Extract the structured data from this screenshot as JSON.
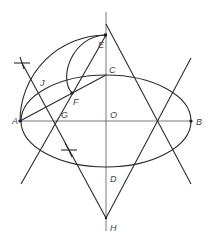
{
  "diagram": {
    "title": "",
    "type": "ellipse construction (concentric circle / parallelogram method)",
    "points": {
      "A": {
        "label": "A",
        "x": 20,
        "y": 121
      },
      "B": {
        "label": "B",
        "x": 191,
        "y": 121
      },
      "C": {
        "label": "C",
        "x": 106,
        "y": 75
      },
      "D": {
        "label": "D",
        "x": 106,
        "y": 167
      },
      "O": {
        "label": "O",
        "x": 106,
        "y": 121
      },
      "E": {
        "label": "E",
        "x": 106,
        "y": 35
      },
      "F": {
        "label": "F",
        "x": 72,
        "y": 93
      },
      "G": {
        "label": "G",
        "x": 55,
        "y": 121
      },
      "H": {
        "label": "H",
        "x": 106,
        "y": 218
      },
      "J": {
        "label": "J",
        "x": 40,
        "y": 82
      }
    },
    "labels": {
      "A": "A",
      "B": "B",
      "C": "C",
      "D": "D",
      "O": "O",
      "E": "E",
      "F": "F",
      "G": "G",
      "H": "H",
      "J": "J"
    },
    "ellipse": {
      "cx": 106,
      "cy": 121,
      "rx": 85,
      "ry": 46
    },
    "stroke_color": "#2a2a2a",
    "background": "#ffffff"
  }
}
